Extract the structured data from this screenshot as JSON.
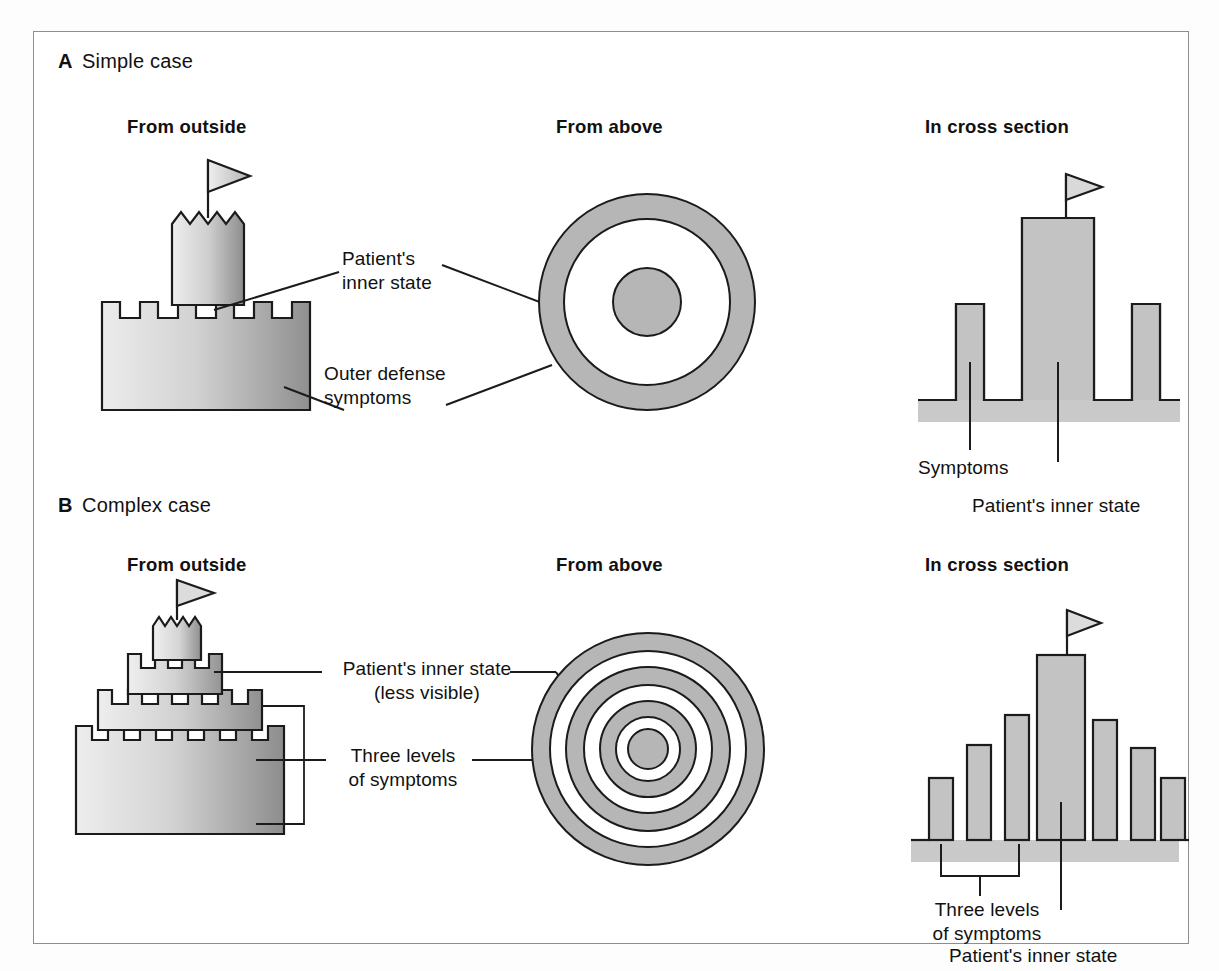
{
  "figure": {
    "background_color": "#ffffff",
    "frame_color": "#8e8e8e",
    "ink_color": "#1b1b1b",
    "fill_gray": "#b9b9b9",
    "ground_gray": "#c9c9c9",
    "gradient_light": "#e8e8e8",
    "gradient_dark": "#9a9a9a"
  },
  "panels": [
    {
      "tag": "A",
      "title": "Simple case",
      "columns": [
        {
          "heading": "From outside"
        },
        {
          "heading": "From above"
        },
        {
          "heading": "In cross section"
        }
      ],
      "labels": {
        "inner_state_line1": "Patient's",
        "inner_state_line2": "inner state",
        "outer_defense_line1": "Outer defense",
        "outer_defense_line2": "symptoms",
        "cross_symptoms": "Symptoms",
        "cross_inner_state": "Patient's inner state"
      },
      "from_above": {
        "rings": 1,
        "has_center_dot": true
      },
      "cross_section": {
        "bar_heights": [
          55,
          150,
          55
        ],
        "center_bar_index": 1,
        "has_flag": true,
        "has_ground_band": true
      },
      "castle": {
        "tiers": 1,
        "has_keep": true,
        "keep_top": "jagged",
        "has_flag": true,
        "merlons_base": 6
      }
    },
    {
      "tag": "B",
      "title": "Complex case",
      "columns": [
        {
          "heading": "From outside"
        },
        {
          "heading": "From above"
        },
        {
          "heading": "In cross section"
        }
      ],
      "labels": {
        "inner_state_line1": "Patient's inner state",
        "inner_state_line2": "(less visible)",
        "three_levels_line1": "Three levels",
        "three_levels_line2": "of symptoms",
        "cross_three_levels_line1": "Three levels",
        "cross_three_levels_line2": "of symptoms",
        "cross_inner_state": "Patient's inner state"
      },
      "from_above": {
        "rings": 3,
        "has_center_dot": true
      },
      "cross_section": {
        "bar_heights": [
          62,
          95,
          125,
          185,
          120,
          92,
          62
        ],
        "center_bar_index": 3,
        "has_flag": true,
        "has_ground_band": true,
        "bracket_bars": 3
      },
      "castle": {
        "tiers": 3,
        "has_keep": true,
        "keep_top": "jagged",
        "has_flag": true,
        "merlons_base": 7
      }
    }
  ],
  "icons": {
    "flag": "flag-icon",
    "castle": "castle-icon",
    "target": "concentric-rings-icon"
  }
}
